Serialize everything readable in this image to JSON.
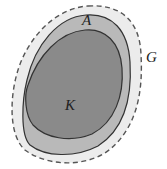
{
  "diagram": {
    "type": "nested-sets",
    "labels": {
      "outer": "G",
      "middle": "A",
      "inner": "K"
    },
    "colors": {
      "background": "#ffffff",
      "outer_fill": "#ececec",
      "middle_fill": "#b9b9b9",
      "inner_fill": "#8a8a8a",
      "stroke": "#333333",
      "outer_stroke": "#555555"
    },
    "outer_boundary_style": "dashed"
  }
}
